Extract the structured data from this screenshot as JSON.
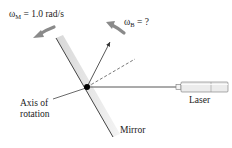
{
  "labels": {
    "omega_m_symbol": "ω",
    "omega_m_sub": "M",
    "omega_m_value": " = 1.0 rad/s",
    "omega_b_symbol": "ω",
    "omega_b_sub": "B",
    "omega_b_value": " = ?",
    "axis_line1": "Axis of",
    "axis_line2": "rotation",
    "laser": "Laser",
    "mirror": "Mirror"
  },
  "colors": {
    "line": "#333333",
    "arrow_gray": "#8a8a8a",
    "mirror_shade": "#e2e2e2",
    "pivot": "#000000"
  }
}
